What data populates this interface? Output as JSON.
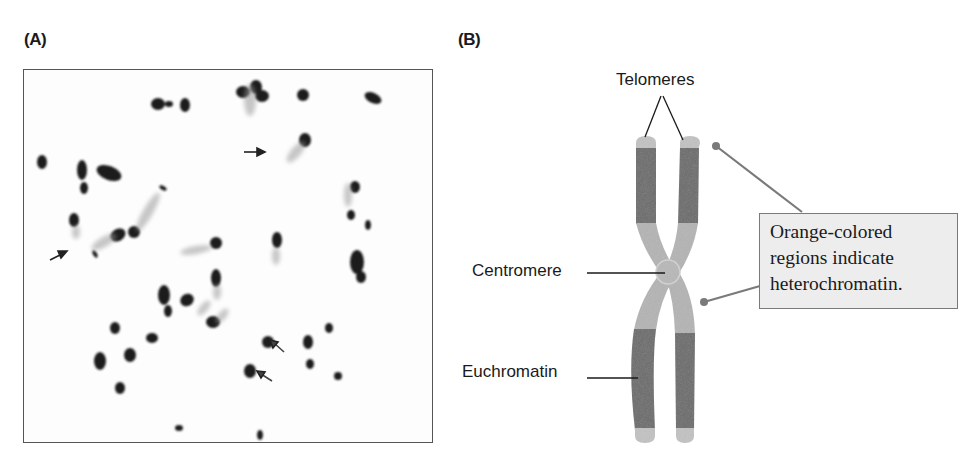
{
  "panels": {
    "a": {
      "label": "(A)",
      "description": "Micrograph of condensed metaphase chromosomes with arrows marking telomeric regions",
      "arrows": [
        {
          "x": 272,
          "y": 151,
          "direction": "right"
        },
        {
          "x": 80,
          "y": 255,
          "direction": "up-right"
        },
        {
          "x": 288,
          "y": 364,
          "direction": "up-left"
        },
        {
          "x": 272,
          "y": 373,
          "direction": "up-left"
        }
      ]
    },
    "b": {
      "label": "(B)",
      "description": "Schematic of a replicated chromosome showing telomeres, centromere, euchromatin and heterochromatin"
    }
  },
  "diagram": {
    "labels": {
      "telomeres": "Telomeres",
      "centromere": "Centromere",
      "euchromatin": "Euchromatin"
    },
    "callout": {
      "lines": [
        "Orange-colored",
        "regions indicate",
        "heterochromatin."
      ]
    },
    "colors": {
      "euchromatin": "#6b6b6b",
      "heterochromatin": "#b4b4b4",
      "telomere": "#c2c2c2",
      "leader_line": "#7a7a7a",
      "callout_bg": "#ededed",
      "callout_border": "#7a7a7a",
      "frame_border": "#555555"
    }
  }
}
